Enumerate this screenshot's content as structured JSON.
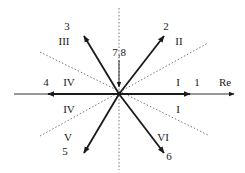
{
  "diagram": {
    "type": "phasor-diagram",
    "axis_label": "Re",
    "colors": {
      "ink": "#1a1a1a",
      "dotted": "#555555",
      "background": "#ffffff"
    },
    "center": [
      119,
      94
    ],
    "vectors": [
      {
        "id": "1",
        "label": "1",
        "direction_deg": 0
      },
      {
        "id": "2",
        "label": "2",
        "direction_deg": 52
      },
      {
        "id": "3",
        "label": "3",
        "direction_deg": 120
      },
      {
        "id": "4",
        "label": "4",
        "direction_deg": 180
      },
      {
        "id": "5",
        "label": "5",
        "direction_deg": 240
      },
      {
        "id": "6",
        "label": "6",
        "direction_deg": 308
      },
      {
        "id": "7,8",
        "label": "7,8",
        "direction_deg": 90,
        "note": "zero vectors, arrow points into origin"
      }
    ],
    "sectors": [
      {
        "label": "I",
        "position": "right-upper"
      },
      {
        "label": "I",
        "position": "right-lower"
      },
      {
        "label": "II",
        "position": "upper-right"
      },
      {
        "label": "III",
        "position": "upper-left"
      },
      {
        "label": "IV",
        "position": "left-upper"
      },
      {
        "label": "IV",
        "position": "left-lower"
      },
      {
        "label": "V",
        "position": "lower-left"
      },
      {
        "label": "VI",
        "position": "lower-right"
      }
    ]
  },
  "labels": {
    "re": "Re",
    "v1": "1",
    "v2": "2",
    "v3": "3",
    "v4": "4",
    "v5": "5",
    "v6": "6",
    "v78": "7,8",
    "s_I_upper": "I",
    "s_I_lower": "I",
    "s_II": "II",
    "s_III": "III",
    "s_IV_upper": "IV",
    "s_IV_lower": "IV",
    "s_V": "V",
    "s_VI": "VI"
  }
}
